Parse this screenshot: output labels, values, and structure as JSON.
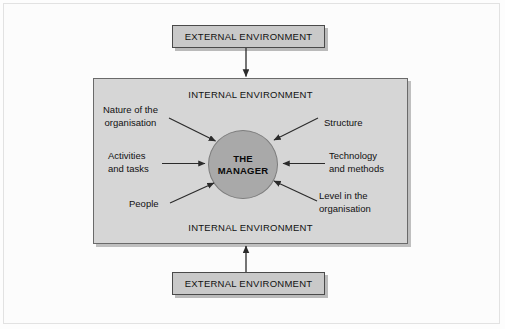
{
  "diagram": {
    "title_alt": "The manager and the internal and external environment",
    "colors": {
      "external_box_fill": "#c9c9c9",
      "internal_box_fill": "#d6d6d6",
      "circle_fill": "#a9a9a9",
      "border": "#4a4a4a",
      "arrow": "#2b2b2b",
      "text": "#111111",
      "page_background": "#fdfdfd"
    },
    "external_top": {
      "label": "EXTERNAL ENVIRONMENT"
    },
    "external_bottom": {
      "label": "EXTERNAL ENVIRONMENT"
    },
    "internal_top": {
      "label": "INTERNAL ENVIRONMENT"
    },
    "internal_bottom": {
      "label": "INTERNAL ENVIRONMENT"
    },
    "center": {
      "line1": "THE",
      "line2": "MANAGER"
    },
    "factors": [
      {
        "id": "nature",
        "line1": "Nature of the",
        "line2": "organisation",
        "side": "left"
      },
      {
        "id": "activities",
        "line1": "Activities",
        "line2": "and tasks",
        "side": "left"
      },
      {
        "id": "people",
        "line1": "People",
        "line2": "",
        "side": "left"
      },
      {
        "id": "structure",
        "line1": "Structure",
        "line2": "",
        "side": "right"
      },
      {
        "id": "technology",
        "line1": "Technology",
        "line2": "and methods",
        "side": "right"
      },
      {
        "id": "level",
        "line1": "Level in the",
        "line2": "organisation",
        "side": "right"
      }
    ],
    "flow_arrows": [
      {
        "id": "external-top-to-internal",
        "direction": "down"
      },
      {
        "id": "external-bottom-to-internal",
        "direction": "up"
      }
    ]
  }
}
